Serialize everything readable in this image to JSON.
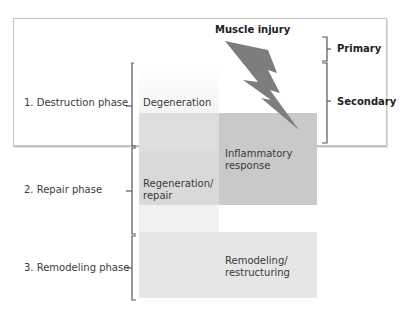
{
  "title": "Muscle injury",
  "injury_types": {
    "primary": "Primary",
    "secondary": "Secondary"
  },
  "phases": [
    {
      "label": "1. Destruction phase"
    },
    {
      "label": "2. Repair phase"
    },
    {
      "label": "3. Remodeling phase"
    }
  ],
  "processes": {
    "degeneration": "Degeneration",
    "inflammatory_line1": "Inflammatory",
    "inflammatory_line2": "response",
    "regeneration_line1": "Regeneration/",
    "regeneration_line2": "repair",
    "remodeling_line1": "Remodeling/",
    "remodeling_line2": "restructuring"
  },
  "colors": {
    "light_box": "#e8e8e8",
    "mid_box": "#dcdcdc",
    "dark_box": "#c6c6c6",
    "bolt": "#7d7d7d",
    "bracket": "#555555"
  }
}
